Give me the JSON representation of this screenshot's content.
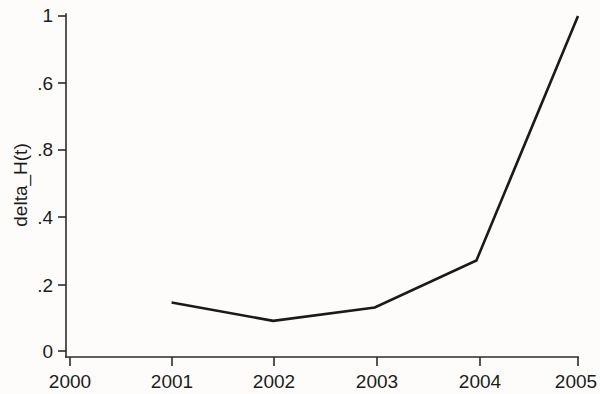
{
  "chart_data": {
    "type": "line",
    "title": "",
    "subtitle": "",
    "xlabel": "",
    "ylabel": "delta_H(t)",
    "x": [
      2001,
      2002,
      2003,
      2004,
      2005
    ],
    "values": [
      0.145,
      0.09,
      0.13,
      0.27,
      1.0
    ],
    "series": [
      {
        "name": "delta_H(t)",
        "values": [
          0.145,
          0.09,
          0.13,
          0.27,
          1.0
        ]
      }
    ],
    "xlim": [
      2000,
      2005
    ],
    "ylim": [
      0,
      1
    ],
    "xticks": [
      2000,
      2001,
      2002,
      2003,
      2004,
      2005
    ],
    "xtick_labels": [
      "2000",
      "2001",
      "2002",
      "2003",
      "2004",
      "2005"
    ],
    "yticks": [
      0,
      0.2,
      0.4,
      0.6,
      0.8,
      1
    ],
    "ytick_labels": [
      "0",
      ".2",
      ".4",
      ".6",
      ".8",
      "1"
    ],
    "grid": false,
    "legend": false,
    "legend_position": "none",
    "line_color": "#1a1a1a",
    "background_color": "#fdfcfa"
  },
  "axis": {
    "y_title": "delta_H(t)",
    "y_labels": [
      "1",
      ".8",
      ".6",
      ".4",
      ".2",
      "0"
    ],
    "x_labels": [
      "2000",
      "2001",
      "2002",
      "2003",
      "2004",
      "2005"
    ]
  }
}
